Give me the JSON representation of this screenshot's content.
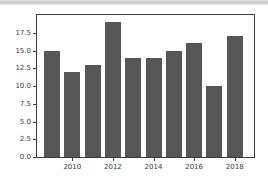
{
  "chart_data": {
    "type": "bar",
    "categories": [
      "2009",
      "2010",
      "2011",
      "2012",
      "2013",
      "2014",
      "2015",
      "2016",
      "2017",
      "2018"
    ],
    "values": [
      15,
      12,
      13,
      19,
      14,
      14,
      15,
      16,
      10,
      17
    ],
    "title": "",
    "xlabel": "",
    "ylabel": "",
    "ylim": [
      0,
      20
    ],
    "ytick_labels": [
      "0.0",
      "2.5",
      "5.0",
      "7.5",
      "10.0",
      "12.5",
      "15.0",
      "17.5"
    ],
    "xtick_labels": [
      "2010",
      "2012",
      "2014",
      "2016",
      "2018"
    ],
    "grid": false,
    "legend": "none",
    "bar_color": "#565656",
    "axis_color": "#3c3c3c",
    "background_color": "#ffffff",
    "top_band_color": "#c8c8c8"
  }
}
